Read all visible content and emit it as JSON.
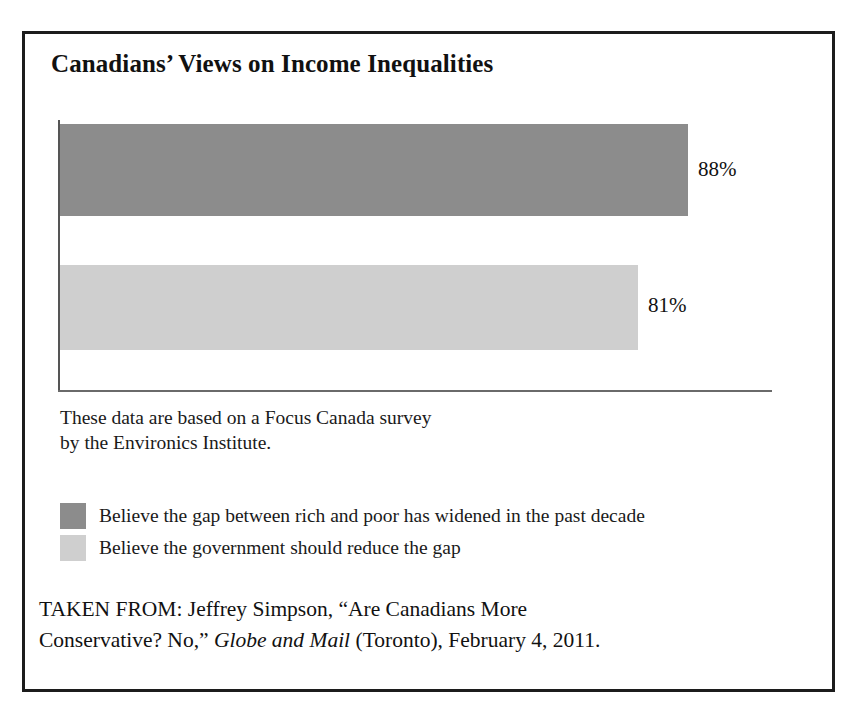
{
  "figure": {
    "title": "Canadians’ Views on Income Inequalities",
    "note_lines": [
      "These data are based on a Focus Canada survey",
      "by the Environics Institute."
    ]
  },
  "colors": {
    "series_dark": "#8c8c8c",
    "series_light": "#cfcfcf",
    "frame": "#1c1c1c",
    "axis": "#6a6a6a",
    "text": "#111111"
  },
  "legend": {
    "items": [
      {
        "swatch": "#8c8c8c",
        "label": "Believe the gap between rich and poor has widened in the past decade"
      },
      {
        "swatch": "#cfcfcf",
        "label": "Believe the government should reduce the gap"
      }
    ]
  },
  "source": {
    "line1_prefix": "TAKEN FROM: Jeffrey Simpson, “Are Canadians More",
    "line2_prefix": "Conservative? No,” ",
    "line2_italic": "Globe and Mail",
    "line2_suffix": " (Toronto), February 4, 2011."
  },
  "chart_data": {
    "type": "bar",
    "orientation": "horizontal",
    "title": "Canadians’ Views on Income Inequalities",
    "xlabel": "",
    "ylabel": "",
    "xlim": [
      0,
      100
    ],
    "grid": false,
    "legend_position": "below-plot",
    "categories": [
      "Believe the gap between rich and poor has widened in the past decade",
      "Believe the government should reduce the gap"
    ],
    "values": [
      88,
      81
    ],
    "value_labels": [
      "88%",
      "81%"
    ],
    "colors": [
      "#8c8c8c",
      "#cfcfcf"
    ],
    "annotation": "These data are based on a Focus Canada survey by the Environics Institute."
  }
}
